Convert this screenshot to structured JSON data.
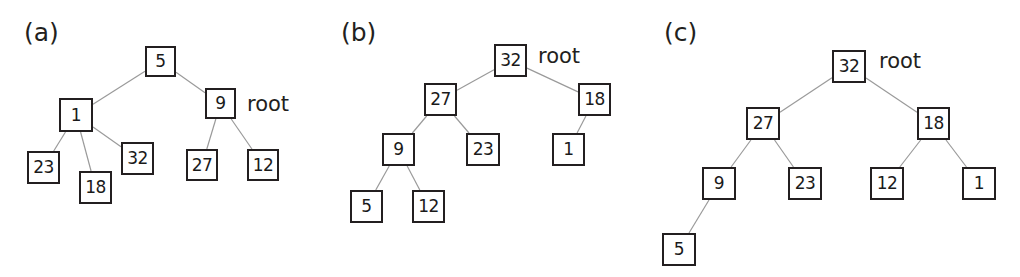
{
  "figure": {
    "width": 1020,
    "height": 277,
    "background": "#ffffff",
    "node_stroke": "#231f20",
    "edge_stroke": "#9a9a9a",
    "text_color": "#231f20"
  },
  "panels": [
    {
      "id": "a",
      "label": "(a)",
      "label_x": 24,
      "label_y": 20,
      "root_label": "root",
      "root_label_x": 247,
      "root_label_y": 94,
      "nodes": [
        {
          "id": "a-5",
          "value": "5",
          "x": 145,
          "y": 46,
          "w": 31,
          "h": 31
        },
        {
          "id": "a-1",
          "value": "1",
          "x": 59,
          "y": 98,
          "w": 34,
          "h": 34
        },
        {
          "id": "a-9",
          "value": "9",
          "x": 205,
          "y": 88,
          "w": 31,
          "h": 31
        },
        {
          "id": "a-23",
          "value": "23",
          "x": 27,
          "y": 151,
          "w": 33,
          "h": 33
        },
        {
          "id": "a-18",
          "value": "18",
          "x": 79,
          "y": 171,
          "w": 33,
          "h": 33
        },
        {
          "id": "a-32",
          "value": "32",
          "x": 121,
          "y": 142,
          "w": 33,
          "h": 33
        },
        {
          "id": "a-27",
          "value": "27",
          "x": 186,
          "y": 149,
          "w": 32,
          "h": 32
        },
        {
          "id": "a-12",
          "value": "12",
          "x": 247,
          "y": 149,
          "w": 32,
          "h": 32
        }
      ],
      "edges": [
        {
          "from": "a-5",
          "to": "a-1"
        },
        {
          "from": "a-5",
          "to": "a-9"
        },
        {
          "from": "a-1",
          "to": "a-23"
        },
        {
          "from": "a-1",
          "to": "a-18"
        },
        {
          "from": "a-1",
          "to": "a-32"
        },
        {
          "from": "a-9",
          "to": "a-27"
        },
        {
          "from": "a-9",
          "to": "a-12"
        }
      ]
    },
    {
      "id": "b",
      "label": "(b)",
      "label_x": 341,
      "label_y": 20,
      "root_label": "root",
      "root_label_x": 538,
      "root_label_y": 46,
      "nodes": [
        {
          "id": "b-32",
          "value": "32",
          "x": 494,
          "y": 44,
          "w": 33,
          "h": 33
        },
        {
          "id": "b-27",
          "value": "27",
          "x": 424,
          "y": 83,
          "w": 33,
          "h": 33
        },
        {
          "id": "b-18",
          "value": "18",
          "x": 578,
          "y": 83,
          "w": 33,
          "h": 33
        },
        {
          "id": "b-9",
          "value": "9",
          "x": 382,
          "y": 133,
          "w": 33,
          "h": 33
        },
        {
          "id": "b-23",
          "value": "23",
          "x": 466,
          "y": 133,
          "w": 34,
          "h": 33
        },
        {
          "id": "b-1",
          "value": "1",
          "x": 552,
          "y": 133,
          "w": 33,
          "h": 33
        },
        {
          "id": "b-5",
          "value": "5",
          "x": 350,
          "y": 190,
          "w": 33,
          "h": 33
        },
        {
          "id": "b-12",
          "value": "12",
          "x": 412,
          "y": 190,
          "w": 33,
          "h": 33
        }
      ],
      "edges": [
        {
          "from": "b-32",
          "to": "b-27"
        },
        {
          "from": "b-32",
          "to": "b-18"
        },
        {
          "from": "b-27",
          "to": "b-9"
        },
        {
          "from": "b-27",
          "to": "b-23"
        },
        {
          "from": "b-18",
          "to": "b-1"
        },
        {
          "from": "b-9",
          "to": "b-5"
        },
        {
          "from": "b-9",
          "to": "b-12"
        }
      ]
    },
    {
      "id": "c",
      "label": "(c)",
      "label_x": 664,
      "label_y": 20,
      "root_label": "root",
      "root_label_x": 879,
      "root_label_y": 51,
      "nodes": [
        {
          "id": "c-32",
          "value": "32",
          "x": 832,
          "y": 50,
          "w": 34,
          "h": 33
        },
        {
          "id": "c-27",
          "value": "27",
          "x": 746,
          "y": 107,
          "w": 34,
          "h": 33
        },
        {
          "id": "c-18",
          "value": "18",
          "x": 917,
          "y": 107,
          "w": 33,
          "h": 33
        },
        {
          "id": "c-9",
          "value": "9",
          "x": 702,
          "y": 167,
          "w": 34,
          "h": 33
        },
        {
          "id": "c-23",
          "value": "23",
          "x": 788,
          "y": 167,
          "w": 34,
          "h": 33
        },
        {
          "id": "c-12",
          "value": "12",
          "x": 870,
          "y": 167,
          "w": 34,
          "h": 33
        },
        {
          "id": "c-1",
          "value": "1",
          "x": 962,
          "y": 167,
          "w": 34,
          "h": 33
        },
        {
          "id": "c-5",
          "value": "5",
          "x": 662,
          "y": 233,
          "w": 34,
          "h": 33
        }
      ],
      "edges": [
        {
          "from": "c-32",
          "to": "c-27"
        },
        {
          "from": "c-32",
          "to": "c-18"
        },
        {
          "from": "c-27",
          "to": "c-9"
        },
        {
          "from": "c-27",
          "to": "c-23"
        },
        {
          "from": "c-18",
          "to": "c-12"
        },
        {
          "from": "c-18",
          "to": "c-1"
        },
        {
          "from": "c-9",
          "to": "c-5"
        }
      ]
    }
  ]
}
